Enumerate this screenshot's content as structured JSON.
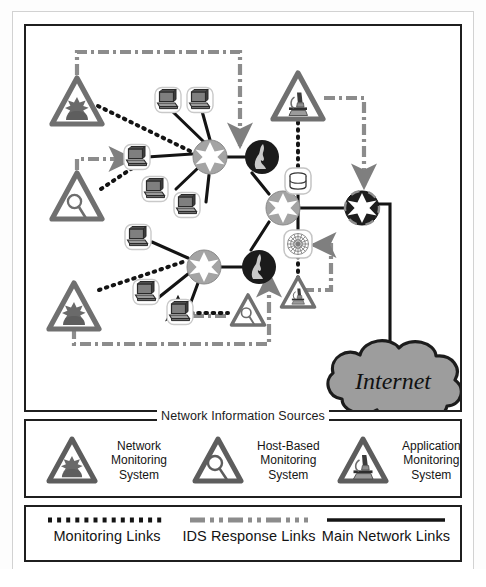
{
  "diagram": {
    "internet_cloud_label": "Internet",
    "colors": {
      "gray_device": "#9a9a9a",
      "dark_node": "#1d1d1d",
      "triangle_outline": "#6e6e6e",
      "ids_response_link": "#8c8c8c",
      "main_link": "#141414",
      "monitoring_link": "#141414",
      "cloud_fill": "#9d9d9d",
      "panel_border": "#1f1f1f"
    },
    "nodes": [
      {
        "id": "nms-top-left",
        "type": "network-monitoring-system",
        "label": "Network Monitoring System",
        "x": 75,
        "y": 73
      },
      {
        "id": "hbms-left",
        "type": "host-based-monitoring-system",
        "label": "Host-Based Monitoring System",
        "x": 75,
        "y": 168
      },
      {
        "id": "nms-bottom-left",
        "type": "network-monitoring-system",
        "label": "Network Monitoring System",
        "x": 72,
        "y": 278
      },
      {
        "id": "hbms-bottom",
        "type": "host-based-monitoring-system",
        "label": "Host-Based Monitoring System",
        "x": 224,
        "y": 305
      },
      {
        "id": "ams-top-right",
        "type": "application-monitoring-system",
        "label": "Application Monitoring System",
        "x": 296,
        "y": 96
      },
      {
        "id": "ams-bottom-right",
        "type": "application-monitoring-system",
        "label": "Application Monitoring System",
        "x": 292,
        "y": 288
      },
      {
        "id": "router-upper-left",
        "type": "router",
        "label": "Router",
        "x": 184,
        "y": 155
      },
      {
        "id": "router-lower-left",
        "type": "router",
        "label": "Router",
        "x": 178,
        "y": 264
      },
      {
        "id": "router-center",
        "type": "router",
        "label": "Router",
        "x": 257,
        "y": 205
      },
      {
        "id": "router-edge",
        "type": "router-edge",
        "label": "Edge Router",
        "x": 336,
        "y": 207
      },
      {
        "id": "firewall-upper",
        "type": "firewall",
        "label": "Firewall",
        "x": 238,
        "y": 157
      },
      {
        "id": "firewall-lower",
        "type": "firewall",
        "label": "Firewall",
        "x": 235,
        "y": 265
      },
      {
        "id": "database-server",
        "type": "database-server",
        "label": "Database Server",
        "x": 296,
        "y": 175
      },
      {
        "id": "web-server",
        "type": "web-server",
        "label": "Web Server",
        "x": 296,
        "y": 243
      },
      {
        "id": "internet",
        "type": "internet-cloud",
        "label": "Internet",
        "x": 367,
        "y": 372
      },
      {
        "id": "ws-1",
        "type": "workstation",
        "label": "Workstation",
        "x": 142,
        "y": 98
      },
      {
        "id": "ws-2",
        "type": "workstation",
        "label": "Workstation",
        "x": 174,
        "y": 98
      },
      {
        "id": "ws-3",
        "type": "workstation",
        "label": "Workstation",
        "x": 135,
        "y": 157
      },
      {
        "id": "ws-4",
        "type": "workstation",
        "label": "Workstation",
        "x": 152,
        "y": 187
      },
      {
        "id": "ws-5",
        "type": "workstation",
        "label": "Workstation",
        "x": 185,
        "y": 203
      },
      {
        "id": "ws-6",
        "type": "workstation",
        "label": "Workstation",
        "x": 136,
        "y": 235
      },
      {
        "id": "ws-7",
        "type": "workstation",
        "label": "Workstation",
        "x": 144,
        "y": 290
      },
      {
        "id": "ws-8",
        "type": "workstation",
        "label": "Workstation",
        "x": 178,
        "y": 310
      }
    ]
  },
  "sources_legend": {
    "title": "Network Information Sources",
    "items": [
      {
        "icon": "network-monitoring-icon",
        "label": "Network\nMonitoring\nSystem"
      },
      {
        "icon": "host-based-monitoring-icon",
        "label": "Host-Based\nMonitoring\nSystem"
      },
      {
        "icon": "application-monitoring-icon",
        "label": "Application\nMonitoring\nSystem"
      }
    ]
  },
  "links_legend": {
    "items": [
      {
        "style": "dotted",
        "icon": "dotted-line-icon",
        "label": "Monitoring Links",
        "color": "#141414"
      },
      {
        "style": "dash-dot",
        "icon": "dash-dot-line-icon",
        "label": "IDS Response Links",
        "color": "#8c8c8c"
      },
      {
        "style": "solid",
        "icon": "solid-line-icon",
        "label": "Main Network Links",
        "color": "#141414"
      }
    ]
  }
}
